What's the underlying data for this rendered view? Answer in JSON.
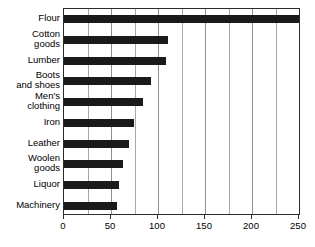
{
  "chart_data": {
    "type": "bar",
    "orientation": "horizontal",
    "title": "",
    "subtitle": "",
    "xlabel": "",
    "ylabel": "",
    "xlim": [
      0,
      250
    ],
    "xticks": [
      0,
      50,
      100,
      150,
      200,
      250
    ],
    "xtick_labels": [
      "0",
      "50",
      "100",
      "150",
      "200",
      "250"
    ],
    "minor_gridlines": [
      25,
      75,
      125,
      175,
      225
    ],
    "grid": true,
    "grid_axis": "x",
    "legend": null,
    "legend_position": "none",
    "bar_color": "#1a1a1a",
    "categories": [
      "Flour",
      "Cotton\ngoods",
      "Lumber",
      "Boots\nand shoes",
      "Men's\nclothing",
      "Iron",
      "Leather",
      "Woolen\ngoods",
      "Liquor",
      "Machinery"
    ],
    "values": [
      250,
      111,
      108,
      93,
      84,
      74,
      69,
      63,
      59,
      56
    ]
  },
  "axis": {
    "tick_labels": [
      "0",
      "50",
      "100",
      "150",
      "200",
      "250"
    ]
  }
}
